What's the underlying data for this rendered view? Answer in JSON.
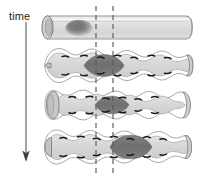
{
  "figure": {
    "domain": "diagram",
    "title_visible": false,
    "background_color": "#ffffff",
    "width": 211,
    "height": 177,
    "axis": {
      "label": "time",
      "direction": "downward",
      "arrow_icon": "down-arrow-icon",
      "arrow_x": 26,
      "arrow_y_start": 22,
      "arrow_y_end": 161,
      "color": "#58595b"
    },
    "reference_lines": {
      "name": "dashed-reference-lines",
      "style": "dashed",
      "color": "#58595b",
      "count": 2,
      "x_positions": [
        96,
        113
      ],
      "y_start": 6,
      "y_end": 174
    },
    "colors": {
      "outline": "#6d6e71",
      "lumen_light": "#dcdcdc",
      "lumen_mid": "#c9c9c9",
      "bolus_dark": "#757575",
      "bolus_soft": "#8a8a8a",
      "tick_dark": "#1a1a1a",
      "wall_white": "#ffffff"
    },
    "panels": [
      {
        "index": 1,
        "name": "panel-straight-tube",
        "label": "",
        "state": "relaxed straight cylinder",
        "y_top": 14,
        "y_bottom": 41,
        "tube_shape": "straight cylinder with elliptical open left end",
        "bolus": {
          "name": "bolus-blob",
          "shape": "soft rounded blob",
          "center_x": 79,
          "center_y": 27,
          "width": 26,
          "height": 15,
          "color": "#8a8a8a",
          "position_relative_to_lines": "left of both dashed lines"
        },
        "wall_ticks": 0
      },
      {
        "index": 2,
        "name": "panel-peristalsis-1",
        "label": "",
        "state": "peristaltic wave, bolus compressed between reference lines",
        "y_top": 47,
        "y_bottom": 84,
        "tube_shape": "undulating tube, narrow closed left end, flared right end",
        "bolus": {
          "name": "bolus-dark-segment",
          "shape": "lens / spindle bulge",
          "center_x": 104,
          "center_y": 65,
          "width": 40,
          "height": 17,
          "color": "#757575",
          "position_relative_to_lines": "spanning and centered on both dashed lines"
        },
        "wall_ticks": 16
      },
      {
        "index": 3,
        "name": "panel-peristalsis-2",
        "label": "",
        "state": "peristaltic wave advanced, bolus narrowed and shifted right",
        "y_top": 88,
        "y_bottom": 122,
        "tube_shape": "undulating tube, wide flared left end, flared right end",
        "bolus": {
          "name": "bolus-dark-segment",
          "shape": "lens / spindle bulge",
          "center_x": 112,
          "center_y": 105,
          "width": 34,
          "height": 13,
          "color": "#757575",
          "position_relative_to_lines": "centered on right dashed line"
        },
        "wall_ticks": 14
      },
      {
        "index": 4,
        "name": "panel-peristalsis-3",
        "label": "",
        "state": "peristaltic wave advanced further, bolus moved right of both lines",
        "y_top": 128,
        "y_bottom": 167,
        "tube_shape": "undulating tube, rounded closed left end, flared right end",
        "bolus": {
          "name": "bolus-dark-segment",
          "shape": "lens / spindle bulge",
          "center_x": 131,
          "center_y": 147,
          "width": 44,
          "height": 19,
          "color": "#757575",
          "position_relative_to_lines": "right of both dashed lines"
        },
        "wall_ticks": 16
      }
    ]
  }
}
